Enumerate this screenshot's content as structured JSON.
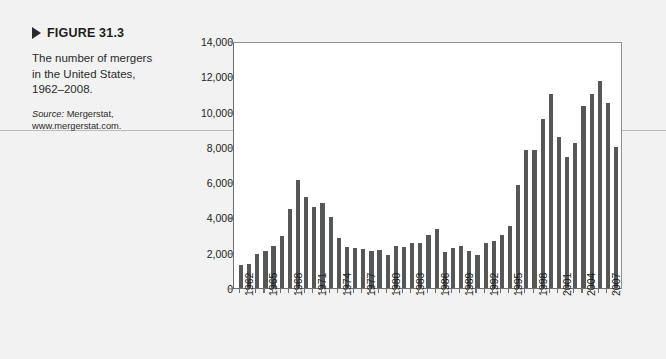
{
  "figure": {
    "label": "FIGURE 31.3",
    "description": "The number of mergers in the United States, 1962–2008.",
    "source_word": "Source:",
    "source_text": " Mergerstat, www.mergerstat.com.",
    "marker_icon": "triangle-right-icon"
  },
  "colors": {
    "page_background": "#f2f2f2",
    "plot_background": "#ffffff",
    "bar": "#555759",
    "axis": "#6f6f6f",
    "text": "#1d1d1d"
  },
  "chart_data": {
    "type": "bar",
    "title": "",
    "xlabel": "",
    "ylabel": "Number of deals",
    "ylim": [
      0,
      14000
    ],
    "yticks": [
      0,
      2000,
      4000,
      6000,
      8000,
      10000,
      12000,
      14000
    ],
    "ytick_labels": [
      "0",
      "2,000",
      "4,000",
      "6,000",
      "8,000",
      "10,000",
      "12,000",
      "14,000"
    ],
    "grid": false,
    "legend": "none",
    "xtick_labels": [
      "1962",
      "1965",
      "1968",
      "1971",
      "1974",
      "1977",
      "1980",
      "1983",
      "1986",
      "1989",
      "1992",
      "1995",
      "1998",
      "2001",
      "2004",
      "2007"
    ],
    "categories": [
      "1962",
      "1963",
      "1964",
      "1965",
      "1966",
      "1967",
      "1968",
      "1969",
      "1970",
      "1971",
      "1972",
      "1973",
      "1974",
      "1975",
      "1976",
      "1977",
      "1978",
      "1979",
      "1980",
      "1981",
      "1982",
      "1983",
      "1984",
      "1985",
      "1986",
      "1987",
      "1988",
      "1989",
      "1990",
      "1991",
      "1992",
      "1993",
      "1994",
      "1995",
      "1996",
      "1997",
      "1998",
      "1999",
      "2000",
      "2001",
      "2002",
      "2003",
      "2004",
      "2005",
      "2006",
      "2007",
      "2008"
    ],
    "values": [
      1300,
      1360,
      1950,
      2125,
      2377,
      2975,
      4462,
      6107,
      5152,
      4608,
      4801,
      4040,
      2861,
      2297,
      2276,
      2224,
      2106,
      2128,
      1889,
      2395,
      2346,
      2533,
      2543,
      3001,
      3336,
      2032,
      2258,
      2366,
      2074,
      1877,
      2574,
      2663,
      2997,
      3510,
      5848,
      7800,
      7809,
      9599,
      11000,
      8545,
      7411,
      8232,
      10296,
      11013,
      11750,
      10506,
      8000
    ]
  }
}
